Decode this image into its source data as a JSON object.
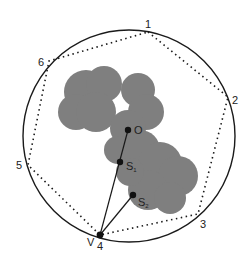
{
  "diagram": {
    "vertex_labels": [
      "1",
      "2",
      "3",
      "4",
      "5",
      "6"
    ],
    "viewpoint_label": "V",
    "center_label": "O",
    "sample_labels": {
      "s1_main": "S",
      "s1_sub": "1",
      "s2_main": "S",
      "s2_sub": "2"
    },
    "colors": {
      "blob": "#7d7d7d",
      "line": "#1a1a1a",
      "background": "#ffffff"
    }
  }
}
